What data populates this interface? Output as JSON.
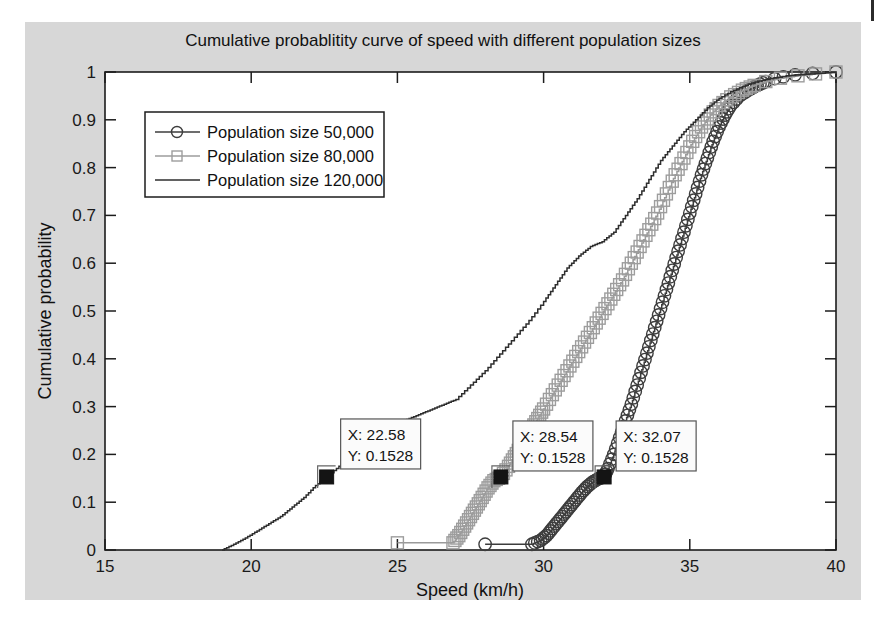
{
  "figure": {
    "background_color": "#d7d7d7",
    "plot_background_color": "#ffffff"
  },
  "chart_data": {
    "type": "line",
    "title": "Cumulative probablitity curve of speed with different population sizes",
    "xlabel": "Speed (km/h)",
    "ylabel": "Cumulative probability",
    "xlim": [
      15,
      40
    ],
    "ylim": [
      0,
      1
    ],
    "xticks": [
      15,
      20,
      25,
      30,
      35,
      40
    ],
    "yticks": [
      0,
      0.1,
      0.2,
      0.3,
      0.4,
      0.5,
      0.6,
      0.7,
      0.8,
      0.9,
      1
    ],
    "xtick_labels": [
      "15",
      "20",
      "25",
      "30",
      "35",
      "40"
    ],
    "ytick_labels": [
      "0",
      "0.1",
      "0.2",
      "0.3",
      "0.4",
      "0.5",
      "0.6",
      "0.7",
      "0.8",
      "0.9",
      "1"
    ],
    "grid": false,
    "legend_position": "upper-left",
    "series": [
      {
        "name": "Population size 50,000",
        "marker": "circle",
        "color": "#3d3d3d",
        "x": [
          28.0,
          29.6,
          29.9,
          30.1,
          30.3,
          30.5,
          30.7,
          30.9,
          31.1,
          31.3,
          31.5,
          31.7,
          31.9,
          32.07,
          32.2,
          32.4,
          32.6,
          32.8,
          33.0,
          33.2,
          33.4,
          33.6,
          33.8,
          34.0,
          34.2,
          34.4,
          34.6,
          34.8,
          35.0,
          35.2,
          35.4,
          35.6,
          35.8,
          36.0,
          36.2,
          36.4,
          36.7,
          37.0,
          37.3,
          37.6,
          37.9,
          38.2,
          38.6,
          39.2,
          40.0
        ],
        "y": [
          0.012,
          0.012,
          0.02,
          0.03,
          0.045,
          0.06,
          0.075,
          0.09,
          0.105,
          0.12,
          0.133,
          0.143,
          0.15,
          0.1528,
          0.17,
          0.2,
          0.235,
          0.27,
          0.305,
          0.345,
          0.385,
          0.425,
          0.465,
          0.505,
          0.545,
          0.585,
          0.625,
          0.665,
          0.705,
          0.745,
          0.785,
          0.82,
          0.855,
          0.885,
          0.91,
          0.93,
          0.95,
          0.962,
          0.972,
          0.98,
          0.986,
          0.99,
          0.994,
          0.997,
          1.0
        ]
      },
      {
        "name": "Population size 80,000",
        "marker": "square",
        "color": "#9a9a9a",
        "x": [
          25.0,
          26.9,
          27.1,
          27.3,
          27.5,
          27.7,
          27.9,
          28.1,
          28.3,
          28.54,
          28.8,
          29.0,
          29.2,
          29.4,
          29.6,
          29.8,
          30.0,
          30.3,
          30.6,
          30.9,
          31.2,
          31.5,
          31.8,
          32.1,
          32.4,
          32.7,
          33.0,
          33.3,
          33.6,
          33.9,
          34.2,
          34.5,
          34.8,
          35.1,
          35.4,
          35.7,
          36.0,
          36.4,
          36.8,
          37.2,
          37.6,
          38.1,
          38.7,
          39.3,
          40.0
        ],
        "y": [
          0.015,
          0.015,
          0.03,
          0.05,
          0.07,
          0.09,
          0.11,
          0.13,
          0.145,
          0.1528,
          0.175,
          0.195,
          0.215,
          0.235,
          0.255,
          0.275,
          0.295,
          0.325,
          0.355,
          0.385,
          0.415,
          0.445,
          0.475,
          0.505,
          0.535,
          0.565,
          0.6,
          0.635,
          0.67,
          0.705,
          0.745,
          0.785,
          0.82,
          0.855,
          0.885,
          0.91,
          0.93,
          0.948,
          0.962,
          0.972,
          0.98,
          0.987,
          0.992,
          0.996,
          1.0
        ]
      },
      {
        "name": "Population size 120,000",
        "marker": "none",
        "color": "#2e2e2e",
        "x": [
          19.0,
          19.4,
          19.8,
          20.2,
          20.6,
          21.0,
          21.4,
          21.8,
          22.2,
          22.58,
          23.0,
          23.4,
          23.8,
          24.2,
          24.6,
          25.0,
          25.4,
          25.8,
          26.2,
          26.6,
          27.0,
          27.5,
          28.0,
          28.5,
          29.0,
          29.5,
          30.0,
          30.4,
          30.8,
          31.2,
          31.6,
          32.0,
          32.4,
          32.8,
          33.2,
          33.6,
          34.0,
          34.4,
          34.8,
          35.2,
          35.6,
          36.0,
          36.5,
          37.0,
          37.6,
          38.3,
          39.1,
          40.0
        ],
        "y": [
          0.0,
          0.012,
          0.025,
          0.04,
          0.055,
          0.07,
          0.09,
          0.11,
          0.135,
          0.1528,
          0.175,
          0.195,
          0.215,
          0.235,
          0.25,
          0.265,
          0.275,
          0.285,
          0.295,
          0.305,
          0.315,
          0.345,
          0.375,
          0.41,
          0.445,
          0.48,
          0.52,
          0.555,
          0.59,
          0.615,
          0.635,
          0.645,
          0.665,
          0.7,
          0.735,
          0.775,
          0.815,
          0.845,
          0.875,
          0.9,
          0.925,
          0.945,
          0.962,
          0.975,
          0.985,
          0.992,
          0.996,
          1.0
        ]
      }
    ],
    "annotations": [
      {
        "label_x": "X: 22.58",
        "label_y": "Y: 0.1528",
        "x": 22.58,
        "y": 0.1528,
        "series": "Population size 120,000"
      },
      {
        "label_x": "X: 28.54",
        "label_y": "Y: 0.1528",
        "x": 28.54,
        "y": 0.1528,
        "series": "Population size 80,000"
      },
      {
        "label_x": "X: 32.07",
        "label_y": "Y: 0.1528",
        "x": 32.07,
        "y": 0.1528,
        "series": "Population size 50,000"
      }
    ]
  }
}
